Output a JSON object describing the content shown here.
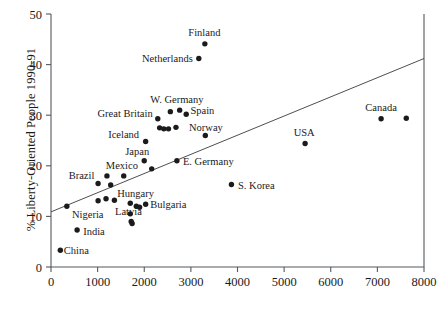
{
  "chart_data": {
    "type": "scatter",
    "title": "",
    "xlabel": "",
    "ylabel": "% Liberty-Oriented People 1990-91",
    "xlim": [
      0,
      8000
    ],
    "ylim": [
      0,
      50
    ],
    "xticks": [
      0,
      1000,
      2000,
      3000,
      4000,
      5000,
      6000,
      7000,
      8000
    ],
    "xtick_labels": [
      "0",
      "1000",
      "2000",
      "3000",
      "4000",
      "5000",
      "6000",
      "7000",
      "8000"
    ],
    "yticks": [
      0,
      10,
      20,
      30,
      40,
      50
    ],
    "ytick_labels": [
      "0",
      "10",
      "20",
      "30",
      "40",
      "50"
    ],
    "grid": false,
    "legend": "none",
    "marker_color": "#1b1b1b",
    "line_color": "#3a3a3a",
    "axis_color": "#555a5e",
    "trend_line": {
      "x": [
        0,
        8000
      ],
      "y": [
        10.9,
        41.2
      ]
    },
    "points": [
      {
        "label": "China",
        "x": 200,
        "y": 3.3,
        "lx": 275,
        "ly": 3.3,
        "anchor": "start"
      },
      {
        "label": "India",
        "x": 560,
        "y": 7.3,
        "lx": 690,
        "ly": 7.0,
        "anchor": "start"
      },
      {
        "label": "Nigeria",
        "x": 340,
        "y": 12.0,
        "lx": 450,
        "ly": 10.3,
        "anchor": "start"
      },
      {
        "label": "Brazil",
        "x": 1010,
        "y": 16.5,
        "lx": 930,
        "ly": 18.1,
        "anchor": "end"
      },
      {
        "label": "Mexico",
        "x": 1560,
        "y": 18.0,
        "lx": 1520,
        "ly": 20.1,
        "anchor": "mid"
      },
      {
        "label": "Hungary",
        "x": 1360,
        "y": 13.2,
        "lx": 1420,
        "ly": 14.5,
        "anchor": "start"
      },
      {
        "label": "Latvia",
        "x": 1700,
        "y": 10.5,
        "lx": 1660,
        "ly": 11.0,
        "anchor": "mid"
      },
      {
        "label": "Bulgaria",
        "x": 2030,
        "y": 12.4,
        "lx": 2130,
        "ly": 12.4,
        "anchor": "start"
      },
      {
        "label": "Japan",
        "x": 2000,
        "y": 21.0,
        "lx": 1850,
        "ly": 22.8,
        "anchor": "mid"
      },
      {
        "label": "Iceland",
        "x": 2030,
        "y": 24.8,
        "lx": 1890,
        "ly": 26.1,
        "anchor": "end"
      },
      {
        "label": "Great Britain",
        "x": 2290,
        "y": 29.3,
        "lx": 2180,
        "ly": 30.4,
        "anchor": "end"
      },
      {
        "label": "W. Germany",
        "x": 2760,
        "y": 31.0,
        "lx": 2700,
        "ly": 33.2,
        "anchor": "mid"
      },
      {
        "label": "Spain",
        "x": 2900,
        "y": 30.2,
        "lx": 2990,
        "ly": 31.0,
        "anchor": "start"
      },
      {
        "label": "Norway",
        "x": 3310,
        "y": 26.0,
        "lx": 2960,
        "ly": 27.6,
        "anchor": "start"
      },
      {
        "label": "E. Germany",
        "x": 2700,
        "y": 21.0,
        "lx": 2830,
        "ly": 20.9,
        "anchor": "start"
      },
      {
        "label": "S. Korea",
        "x": 3870,
        "y": 16.3,
        "lx": 4010,
        "ly": 16.2,
        "anchor": "start"
      },
      {
        "label": "Netherlands",
        "x": 3170,
        "y": 41.2,
        "lx": 3040,
        "ly": 41.3,
        "anchor": "end"
      },
      {
        "label": "Finland",
        "x": 3300,
        "y": 44.1,
        "lx": 3290,
        "ly": 46.3,
        "anchor": "mid"
      },
      {
        "label": "USA",
        "x": 5450,
        "y": 24.4,
        "lx": 5430,
        "ly": 26.6,
        "anchor": "mid"
      },
      {
        "label": "Canada",
        "x": 7080,
        "y": 29.3,
        "lx": 7080,
        "ly": 31.6,
        "anchor": "mid"
      },
      {
        "label": "",
        "x": 1200,
        "y": 18.0
      },
      {
        "label": "",
        "x": 1280,
        "y": 16.2
      },
      {
        "label": "",
        "x": 1180,
        "y": 13.5
      },
      {
        "label": "",
        "x": 1010,
        "y": 13.1
      },
      {
        "label": "",
        "x": 1700,
        "y": 12.6
      },
      {
        "label": "",
        "x": 1830,
        "y": 12.0
      },
      {
        "label": "",
        "x": 1900,
        "y": 11.8
      },
      {
        "label": "",
        "x": 1720,
        "y": 9.0
      },
      {
        "label": "",
        "x": 1740,
        "y": 8.6
      },
      {
        "label": "",
        "x": 2160,
        "y": 19.4
      },
      {
        "label": "",
        "x": 2420,
        "y": 27.3
      },
      {
        "label": "",
        "x": 2520,
        "y": 27.3
      },
      {
        "label": "",
        "x": 2680,
        "y": 27.6
      },
      {
        "label": "",
        "x": 2330,
        "y": 27.5
      },
      {
        "label": "",
        "x": 2560,
        "y": 30.7
      },
      {
        "label": "",
        "x": 7620,
        "y": 29.4
      }
    ]
  }
}
